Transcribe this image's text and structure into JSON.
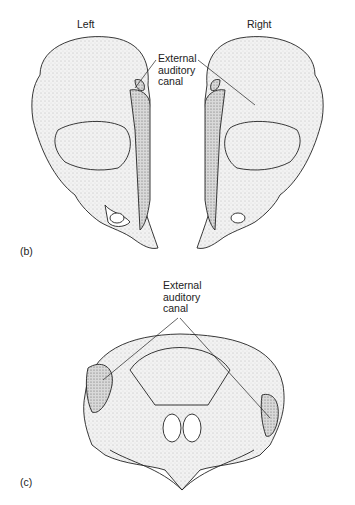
{
  "figure_b": {
    "panel_label": "(b)",
    "left_label": "Left",
    "right_label": "Right",
    "annotation": "External\nauditory\ncanal"
  },
  "figure_c": {
    "panel_label": "(c)",
    "annotation": "External\nauditory\ncanal"
  },
  "colors": {
    "ink": "#222222",
    "shade": "#d8d8d8",
    "dark_shade": "#9a9a9a",
    "background": "#ffffff"
  }
}
